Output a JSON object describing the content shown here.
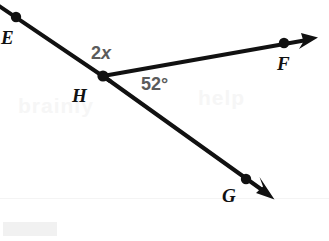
{
  "figure": {
    "type": "geometry-angle-diagram",
    "background_color": "#ffffff",
    "stroke_color": "#111111",
    "label_color": "#111111",
    "measure_color": "#5b5b5b",
    "points": [
      {
        "name": "E",
        "label": "E",
        "x": 16,
        "y": 17,
        "label_x": 1,
        "label_y": 28,
        "dot": true
      },
      {
        "name": "H",
        "label": "H",
        "x": 103,
        "y": 76,
        "label_x": 72,
        "label_y": 86,
        "dot": true
      },
      {
        "name": "F",
        "label": "F",
        "x": 284,
        "y": 43,
        "label_x": 277,
        "label_y": 54,
        "dot": true
      },
      {
        "name": "G",
        "label": "G",
        "x": 246,
        "y": 179,
        "label_x": 222,
        "label_y": 186,
        "dot": true
      }
    ],
    "rays": [
      {
        "name": "ray-HF",
        "from": "H",
        "through": "F",
        "arrow_tip_x": 316,
        "arrow_tip_y": 38
      },
      {
        "name": "ray-HG",
        "from": "H",
        "through": "G",
        "arrow_tip_x": 273,
        "arrow_tip_y": 198
      },
      {
        "name": "segment-EH",
        "from": "E-extension",
        "through": "H",
        "arrow_tip_x": null,
        "arrow_tip_y": null
      }
    ],
    "angles": [
      {
        "name": "angle-EHF",
        "expression": "2x",
        "expr_number": "2",
        "expr_variable": "x",
        "x": 91,
        "y": 44
      },
      {
        "name": "angle-FHG",
        "measure": "52°",
        "value": 52,
        "unit": "degrees",
        "x": 141,
        "y": 75
      }
    ],
    "watermarks": [
      {
        "name": "watermark-block-bottom-left",
        "x": 3,
        "y": 222,
        "width": 54,
        "height": 14
      },
      {
        "name": "watermark-ghost-left",
        "text": "brainly",
        "x": 18,
        "y": 94
      },
      {
        "name": "watermark-ghost-right",
        "text": "help",
        "x": 198,
        "y": 86
      },
      {
        "name": "watermark-hairline",
        "x": 0,
        "y": 198,
        "width": 329
      }
    ]
  }
}
